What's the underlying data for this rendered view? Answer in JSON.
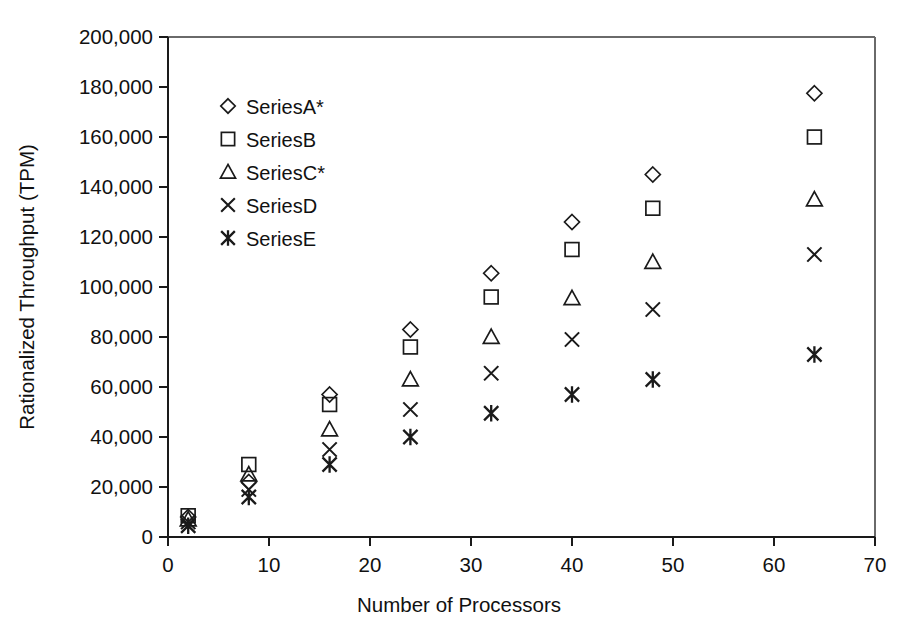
{
  "chart_data": {
    "type": "scatter",
    "title": "",
    "xlabel": "Number of Processors",
    "ylabel": "Rationalized Throughput (TPM)",
    "xlim": [
      0,
      70
    ],
    "ylim": [
      0,
      200000
    ],
    "xticks": [
      0,
      10,
      20,
      30,
      40,
      50,
      60,
      70
    ],
    "xtick_labels": [
      "0",
      "10",
      "20",
      "30",
      "40",
      "50",
      "60",
      "70"
    ],
    "yticks": [
      0,
      20000,
      40000,
      60000,
      80000,
      100000,
      120000,
      140000,
      160000,
      180000,
      200000
    ],
    "ytick_labels": [
      "0",
      "20,000",
      "40,000",
      "60,000",
      "80,000",
      "100,000",
      "120,000",
      "140,000",
      "160,000",
      "180,000",
      "200,000"
    ],
    "grid": false,
    "legend_position": "upper-left-inside",
    "x": [
      2,
      8,
      16,
      24,
      32,
      40,
      48,
      64
    ],
    "series": [
      {
        "name": "SeriesA*",
        "marker": "diamond",
        "values": [
          8000,
          22000,
          57000,
          83000,
          105500,
          126000,
          145000,
          177500
        ]
      },
      {
        "name": "SeriesB",
        "marker": "square",
        "values": [
          8500,
          29000,
          53000,
          76000,
          96000,
          115000,
          131500,
          160000
        ]
      },
      {
        "name": "SeriesC*",
        "marker": "triangle",
        "values": [
          7000,
          25000,
          43000,
          63000,
          80000,
          95500,
          110000,
          135000
        ]
      },
      {
        "name": "SeriesD",
        "marker": "cross",
        "values": [
          6000,
          19000,
          35000,
          51000,
          65500,
          79000,
          91000,
          113000
        ]
      },
      {
        "name": "SeriesE",
        "marker": "star",
        "values": [
          4500,
          16000,
          29000,
          40000,
          49500,
          57000,
          63000,
          73000
        ]
      }
    ]
  },
  "legend": {
    "items": [
      {
        "label": "SeriesA*",
        "marker": "diamond"
      },
      {
        "label": "SeriesB",
        "marker": "square"
      },
      {
        "label": "SeriesC*",
        "marker": "triangle"
      },
      {
        "label": "SeriesD",
        "marker": "cross"
      },
      {
        "label": "SeriesE",
        "marker": "star"
      }
    ]
  },
  "colors": {
    "ink": "#1a1a1a",
    "frame": "#6a6a6a",
    "background": "#ffffff"
  }
}
